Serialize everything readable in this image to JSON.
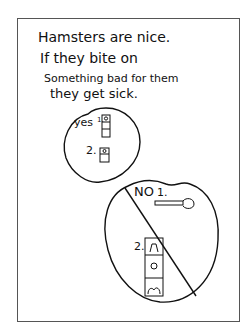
{
  "drawing": {
    "text_lines": [
      "Hamsters are nice.",
      "If they bite on",
      "Something bad for them",
      "they get sick."
    ],
    "yes_circle": {
      "label": "yes",
      "item1": "1.",
      "item2": "2."
    },
    "no_circle": {
      "label": "NO",
      "item1": "1.",
      "item2": "2."
    },
    "colors": {
      "ink": "#111111",
      "paper": "#ffffff",
      "frame": "#555555"
    }
  }
}
